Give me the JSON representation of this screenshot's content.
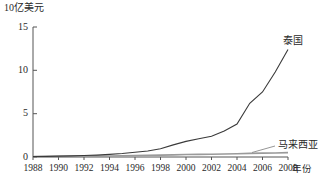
{
  "chart_data": {
    "type": "line",
    "title": "",
    "ylabel": "10亿美元",
    "xlabel": "年份",
    "xlim": [
      1988,
      2008
    ],
    "ylim": [
      0,
      15
    ],
    "grid": false,
    "legend_position": "inline-right-end-labels",
    "yticks": [
      "0",
      "5",
      "10",
      "15"
    ],
    "ytick_values": [
      0,
      5,
      10,
      15
    ],
    "xticks": [
      "1988",
      "1990",
      "1992",
      "1994",
      "1996",
      "1998",
      "2000",
      "2002",
      "2004",
      "2006",
      "2008"
    ],
    "xtick_values": [
      1988,
      1990,
      1992,
      1994,
      1996,
      1998,
      2000,
      2002,
      2004,
      2006,
      2008
    ],
    "x": [
      1988,
      1989,
      1990,
      1991,
      1992,
      1993,
      1994,
      1995,
      1996,
      1997,
      1998,
      1999,
      2000,
      2001,
      2002,
      2003,
      2004,
      2005,
      2006,
      2007,
      2008
    ],
    "series": [
      {
        "name": "泰国",
        "color": "#3a3a3a",
        "values": [
          0.05,
          0.07,
          0.1,
          0.13,
          0.17,
          0.22,
          0.3,
          0.4,
          0.55,
          0.7,
          0.95,
          1.4,
          1.8,
          2.1,
          2.4,
          3.0,
          3.8,
          6.2,
          7.5,
          9.8,
          12.4
        ]
      },
      {
        "name": "马来西亚",
        "color": "#9a9a9a",
        "values": [
          0.05,
          0.06,
          0.07,
          0.08,
          0.09,
          0.1,
          0.12,
          0.15,
          0.18,
          0.2,
          0.22,
          0.25,
          0.28,
          0.3,
          0.32,
          0.35,
          0.38,
          0.42,
          0.45,
          0.47,
          0.5
        ]
      }
    ],
    "annotations": [
      {
        "text": "泰国",
        "series": "泰国"
      },
      {
        "text": "马来西亚",
        "series": "马来西亚"
      }
    ]
  }
}
